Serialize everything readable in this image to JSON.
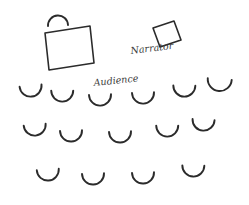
{
  "diagram": {
    "background_color": "#ffffff",
    "ink_color": "#2b2b2b",
    "label_color": "#3a3a3a",
    "width": 249,
    "height": 205,
    "labels": {
      "narrator": "Narrator",
      "audience": "Audience"
    },
    "label_placement": {
      "narrator": {
        "x": 131,
        "y": 54,
        "rotate": -7,
        "font_size": 9.5
      },
      "audience": {
        "x": 94,
        "y": 86,
        "rotate": -6,
        "font_size": 9.5
      }
    },
    "tables": [
      {
        "name": "presenter-table",
        "points": "45,33 90,26 94,63 49,70",
        "description": "large tilted square table at upper left"
      },
      {
        "name": "narrator-table",
        "points": "153,28 174,21 181,40 160,47",
        "description": "small tilted square table beside the Narrator label"
      }
    ],
    "presenter_seat": {
      "name": "presenter-seat",
      "path": "M 48 26 A 10 10 0 0 1 68 25",
      "opening": "down",
      "description": "arc seat above the presenter table, opening downward"
    },
    "audience_rows": [
      {
        "row": 1,
        "seat_count": 6,
        "seats": [
          {
            "cx": 31,
            "cy": 92,
            "r": 11,
            "rotate": -4
          },
          {
            "cx": 62,
            "cy": 97,
            "r": 11,
            "rotate": 2
          },
          {
            "cx": 100,
            "cy": 101,
            "r": 11,
            "rotate": 0
          },
          {
            "cx": 143,
            "cy": 99,
            "r": 11,
            "rotate": 0
          },
          {
            "cx": 184,
            "cy": 92,
            "r": 11,
            "rotate": 3
          },
          {
            "cx": 219,
            "cy": 86,
            "r": 12,
            "rotate": 6
          }
        ]
      },
      {
        "row": 2,
        "seat_count": 5,
        "seats": [
          {
            "cx": 35,
            "cy": 131,
            "r": 11,
            "rotate": -3
          },
          {
            "cx": 71,
            "cy": 137,
            "r": 11,
            "rotate": 0
          },
          {
            "cx": 120,
            "cy": 138,
            "r": 11,
            "rotate": 0
          },
          {
            "cx": 167,
            "cy": 132,
            "r": 11,
            "rotate": 2
          },
          {
            "cx": 203,
            "cy": 126,
            "r": 11,
            "rotate": 5
          }
        ]
      },
      {
        "row": 3,
        "seat_count": 4,
        "seats": [
          {
            "cx": 48,
            "cy": 176,
            "r": 11,
            "rotate": -2
          },
          {
            "cx": 93,
            "cy": 180,
            "r": 11,
            "rotate": 0
          },
          {
            "cx": 143,
            "cy": 179,
            "r": 11,
            "rotate": 0
          },
          {
            "cx": 193,
            "cy": 172,
            "r": 11,
            "rotate": 3
          }
        ]
      }
    ]
  }
}
